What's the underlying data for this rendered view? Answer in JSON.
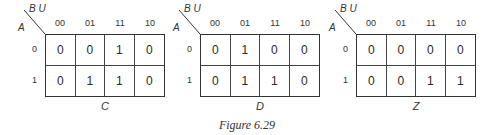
{
  "figure": {
    "caption": "Figure 6.29",
    "row_var": "A",
    "col_vars": "B U",
    "col_headers": [
      "00",
      "01",
      "11",
      "10"
    ],
    "row_headers": [
      "0",
      "1"
    ]
  },
  "kmaps": [
    {
      "name": "C",
      "rows": [
        [
          "0",
          "0",
          "1",
          "0"
        ],
        [
          "0",
          "1",
          "1",
          "0"
        ]
      ]
    },
    {
      "name": "D",
      "rows": [
        [
          "0",
          "1",
          "0",
          "0"
        ],
        [
          "0",
          "1",
          "1",
          "0"
        ]
      ]
    },
    {
      "name": "Z",
      "rows": [
        [
          "0",
          "0",
          "0",
          "0"
        ],
        [
          "0",
          "0",
          "1",
          "1"
        ]
      ]
    }
  ]
}
